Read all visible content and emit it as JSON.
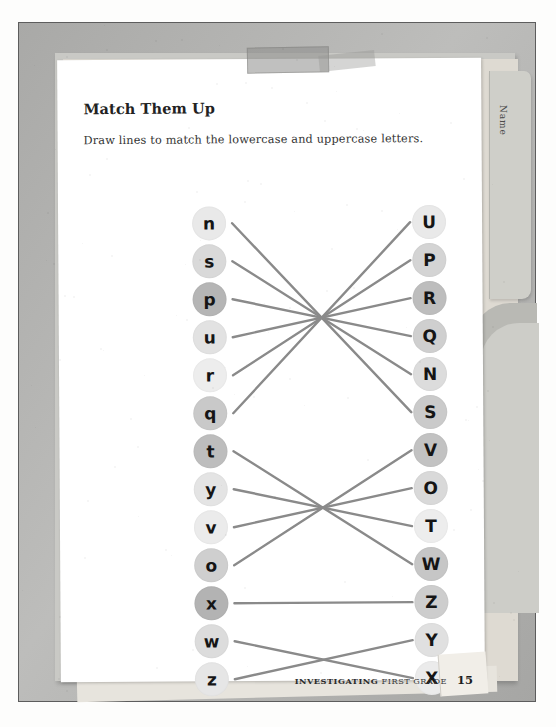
{
  "worksheet": {
    "title": "Match Them Up",
    "instruction": "Draw lines to match the lowercase and uppercase letters.",
    "folder_tab_label": "Name",
    "footer": {
      "brand_bold": "INVESTIGATING",
      "brand_light": "FIRST GRADE",
      "page_number": "15"
    }
  },
  "colors": {
    "line": "#8a8a8a",
    "bubble_light": "#ededed",
    "bubble_mid": "#d8d8d8",
    "bubble_dark": "#b9b9b9",
    "page": "#ffffff",
    "frame": "#a9a9a7",
    "text": "#222222"
  },
  "match": {
    "left_column": [
      {
        "letter": "n",
        "shade": "#e9e9e9",
        "y": 7
      },
      {
        "letter": "s",
        "shade": "#d9d9d9",
        "y": 45
      },
      {
        "letter": "p",
        "shade": "#b5b5b5",
        "y": 83
      },
      {
        "letter": "u",
        "shade": "#e2e2e2",
        "y": 121
      },
      {
        "letter": "r",
        "shade": "#ededed",
        "y": 159
      },
      {
        "letter": "q",
        "shade": "#c9c9c9",
        "y": 197
      },
      {
        "letter": "t",
        "shade": "#bdbdbd",
        "y": 235
      },
      {
        "letter": "y",
        "shade": "#e4e4e4",
        "y": 273
      },
      {
        "letter": "v",
        "shade": "#ebebeb",
        "y": 311
      },
      {
        "letter": "o",
        "shade": "#cfcfcf",
        "y": 349
      },
      {
        "letter": "x",
        "shade": "#b3b3b3",
        "y": 387
      },
      {
        "letter": "w",
        "shade": "#dcdcdc",
        "y": 425
      },
      {
        "letter": "z",
        "shade": "#e6e6e6",
        "y": 463
      }
    ],
    "right_column": [
      {
        "letter": "U",
        "shade": "#e9e9e9",
        "y": 7
      },
      {
        "letter": "P",
        "shade": "#d4d4d4",
        "y": 45
      },
      {
        "letter": "R",
        "shade": "#bdbdbd",
        "y": 83
      },
      {
        "letter": "Q",
        "shade": "#cfcfcf",
        "y": 121
      },
      {
        "letter": "N",
        "shade": "#dcdcdc",
        "y": 159
      },
      {
        "letter": "S",
        "shade": "#cacaca",
        "y": 197
      },
      {
        "letter": "V",
        "shade": "#c2c2c2",
        "y": 235
      },
      {
        "letter": "O",
        "shade": "#d9d9d9",
        "y": 273
      },
      {
        "letter": "T",
        "shade": "#ededed",
        "y": 311
      },
      {
        "letter": "W",
        "shade": "#c6c6c6",
        "y": 349
      },
      {
        "letter": "Z",
        "shade": "#cdcdcd",
        "y": 387
      },
      {
        "letter": "Y",
        "shade": "#e0e0e0",
        "y": 425
      },
      {
        "letter": "X",
        "shade": "#ebebeb",
        "y": 463
      }
    ],
    "connections": [
      {
        "from": "n",
        "to": "S",
        "from_y": 24,
        "to_y": 214
      },
      {
        "from": "s",
        "to": "N",
        "from_y": 62,
        "to_y": 176
      },
      {
        "from": "p",
        "to": "Q",
        "from_y": 100,
        "to_y": 138
      },
      {
        "from": "u",
        "to": "R",
        "from_y": 138,
        "to_y": 100
      },
      {
        "from": "r",
        "to": "P",
        "from_y": 176,
        "to_y": 62
      },
      {
        "from": "q",
        "to": "U",
        "from_y": 214,
        "to_y": 24
      },
      {
        "from": "t",
        "to": "W",
        "from_y": 252,
        "to_y": 366
      },
      {
        "from": "y",
        "to": "T",
        "from_y": 290,
        "to_y": 328
      },
      {
        "from": "v",
        "to": "O",
        "from_y": 328,
        "to_y": 290
      },
      {
        "from": "o",
        "to": "V",
        "from_y": 366,
        "to_y": 252
      },
      {
        "from": "x",
        "to": "Z",
        "from_y": 404,
        "to_y": 404
      },
      {
        "from": "w",
        "to": "X",
        "from_y": 442,
        "to_y": 480
      },
      {
        "from": "z",
        "to": "Y",
        "from_y": 480,
        "to_y": 442
      }
    ]
  }
}
